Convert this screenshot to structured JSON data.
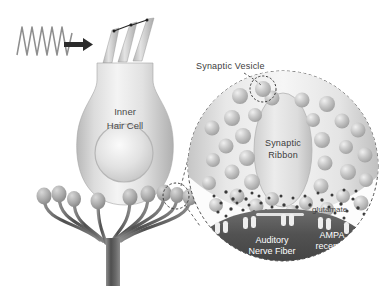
{
  "figure": {
    "background_color": "#ffffff",
    "width": 390,
    "height": 300
  },
  "labels": {
    "inner_hair_cell_line1": "Inner",
    "inner_hair_cell_line2": "Hair Cell",
    "synaptic_vesicle": "Synaptic Vesicle",
    "synaptic_ribbon_line1": "Synaptic",
    "synaptic_ribbon_line2": "Ribbon",
    "glutamate": "glutamate",
    "auditory_nerve_fiber_line1": "Auditory",
    "auditory_nerve_fiber_line2": "Nerve Fiber",
    "ampa_receptor_line1": "AMPA",
    "ampa_receptor_line2": "receptor"
  },
  "colors": {
    "cell_body_light": "#f2f2f2",
    "cell_body_mid": "#d0d0d0",
    "cell_body_edge": "#a8a8a8",
    "nucleus": "#d8d8d8",
    "vesicle": "#c4c4c4",
    "vesicle_highlight": "#eeeeee",
    "nerve_fiber_dark": "#5a5a5a",
    "nerve_trunk": "#6a6a6a",
    "stereocilia": "#c0c0c0",
    "sound_wave": "#8a8a8a",
    "arrow": "#2b2b2b",
    "glutamate_dot": "#3a3a3a",
    "receptor_peg": "#e8e8e8",
    "dashed_outline": "#555555",
    "text_dark": "#3c3c3c",
    "text_white": "#ffffff"
  },
  "elements": {
    "sound_wave_cycles": 6,
    "stereocilia_count": 3,
    "nerve_terminal_count": 9,
    "vesicle_count_in_magnifier": 34,
    "glutamate_dot_count": 46,
    "receptor_peg_count": 8,
    "magnifier_style": "dashed-circle",
    "arrow_direction": "right"
  },
  "icons": {
    "sound_wave": "sine-wave-icon",
    "arrow": "right-arrow-icon",
    "magnifier": "magnifier-circle-icon",
    "callout": "dashed-callout-icon"
  }
}
